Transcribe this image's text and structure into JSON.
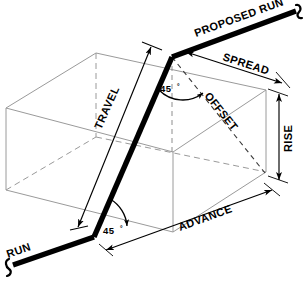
{
  "diagram": {
    "type": "isometric-technical-drawing",
    "colors": {
      "pipe": "#000000",
      "box_edge": "#9a9a9a",
      "dimension": "#000000",
      "hidden_dash": "#3a3a3a",
      "background": "#ffffff"
    },
    "labels": {
      "run": "RUN",
      "proposed_run": "PROPOSED RUN",
      "travel": "TRAVEL",
      "offset": "OFFSET",
      "spread": "SPREAD",
      "rise": "RISE",
      "advance": "ADVANCE",
      "angle_top": "45",
      "angle_top_unit": "°",
      "angle_bottom": "45",
      "angle_bottom_unit": "°"
    },
    "dimensions": [
      {
        "name": "travel",
        "label": "TRAVEL",
        "style": "double-arrow"
      },
      {
        "name": "offset",
        "label": "OFFSET",
        "style": "dashed"
      },
      {
        "name": "spread",
        "label": "SPREAD",
        "style": "double-arrow"
      },
      {
        "name": "rise",
        "label": "RISE",
        "style": "double-arrow-vertical"
      },
      {
        "name": "advance",
        "label": "ADVANCE",
        "style": "double-arrow"
      }
    ],
    "angles": [
      {
        "name": "upper-bend",
        "value": "45",
        "unit": "°"
      },
      {
        "name": "lower-bend",
        "value": "45",
        "unit": "°"
      }
    ]
  }
}
